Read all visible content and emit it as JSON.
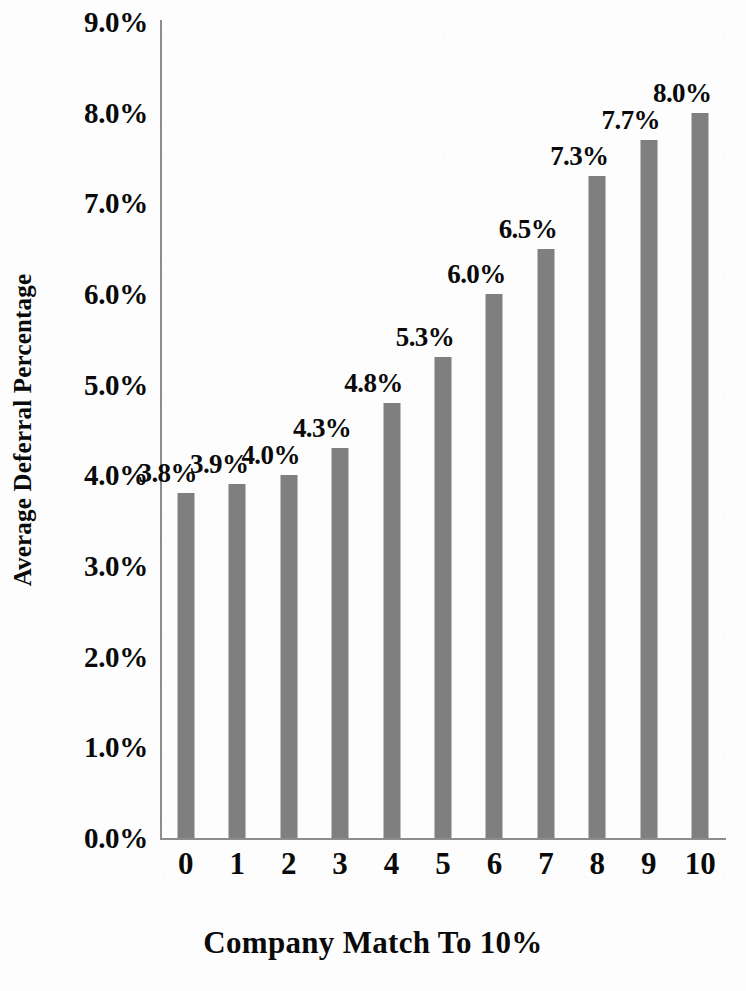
{
  "chart_data": {
    "type": "bar",
    "title": "",
    "xlabel": "Company Match To 10%",
    "ylabel": "Average Deferral Percentage",
    "categories": [
      "0",
      "1",
      "2",
      "3",
      "4",
      "5",
      "6",
      "7",
      "8",
      "9",
      "10"
    ],
    "values": [
      3.8,
      3.9,
      4.0,
      4.3,
      4.8,
      5.3,
      6.0,
      6.5,
      7.3,
      7.7,
      8.0
    ],
    "value_labels": [
      "3.8%",
      "3.9%",
      "4.0%",
      "4.3%",
      "4.8%",
      "5.3%",
      "6.0%",
      "6.5%",
      "7.3%",
      "7.7%",
      "8.0%"
    ],
    "ylim": [
      0.0,
      9.0
    ],
    "ytick_values": [
      0.0,
      1.0,
      2.0,
      3.0,
      4.0,
      5.0,
      6.0,
      7.0,
      8.0,
      9.0
    ],
    "ytick_labels": [
      "0.0%",
      "1.0%",
      "2.0%",
      "3.0%",
      "4.0%",
      "5.0%",
      "6.0%",
      "7.0%",
      "8.0%",
      "9.0%"
    ],
    "grid": false,
    "legend": null,
    "bar_color": "#7f7f7f",
    "axis_color": "#8d8d8d",
    "text_color": "#0a0a0a",
    "background_color": "#fdfdfd"
  }
}
